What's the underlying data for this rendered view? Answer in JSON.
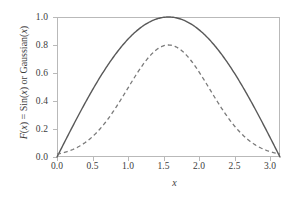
{
  "chart_data": {
    "type": "line",
    "title": "",
    "xlabel": "x",
    "ylabel": "F(x) = Sin(x) or Gaussian(x)",
    "xlim": [
      0.0,
      3.14159
    ],
    "ylim": [
      0.0,
      1.0
    ],
    "grid": false,
    "legend": null,
    "xticks": [
      "0.0",
      "0.5",
      "1.0",
      "1.5",
      "2.0",
      "2.5",
      "3.0"
    ],
    "xtick_values": [
      0.0,
      0.5,
      1.0,
      1.5,
      2.0,
      2.5,
      3.0
    ],
    "yticks": [
      "0.0",
      "0.2",
      "0.4",
      "0.6",
      "0.8",
      "1.0"
    ],
    "ytick_values": [
      0.0,
      0.2,
      0.4,
      0.6,
      0.8,
      1.0
    ],
    "series": [
      {
        "name": "Sin(x)",
        "style": "solid",
        "color": "#595959",
        "peak_x": 1.5708,
        "peak_y": 1.0,
        "x": [
          0.0,
          0.1571,
          0.3142,
          0.4712,
          0.6283,
          0.7854,
          0.9425,
          1.0996,
          1.2566,
          1.4137,
          1.5708,
          1.7279,
          1.885,
          2.042,
          2.1991,
          2.3562,
          2.5133,
          2.6704,
          2.8274,
          2.9845,
          3.1416
        ],
        "values": [
          0.0,
          0.1564,
          0.309,
          0.454,
          0.5878,
          0.7071,
          0.809,
          0.891,
          0.9511,
          0.9877,
          1.0,
          0.9877,
          0.9511,
          0.891,
          0.809,
          0.7071,
          0.5878,
          0.454,
          0.309,
          0.1564,
          0.0
        ]
      },
      {
        "name": "Gaussian(x)",
        "style": "dashed",
        "color": "#7a7a7a",
        "amplitude": 0.8,
        "center": 1.5708,
        "sigma": 0.58,
        "peak_x": 1.5708,
        "peak_y": 0.8,
        "x": [
          0.0,
          0.1571,
          0.3142,
          0.4712,
          0.6283,
          0.7854,
          0.9425,
          1.0996,
          1.2566,
          1.4137,
          1.5708,
          1.7279,
          1.885,
          2.042,
          2.1991,
          2.3562,
          2.5133,
          2.6704,
          2.8274,
          2.9845,
          3.1416
        ],
        "values": [
          0.0201,
          0.0333,
          0.0526,
          0.0795,
          0.1151,
          0.1595,
          0.2117,
          0.269,
          0.3277,
          0.383,
          0.4304,
          0.4665,
          0.4891,
          0.4975,
          0.4921,
          0.4747,
          0.4476,
          0.4136,
          0.3754,
          0.3354,
          0.2957
        ]
      }
    ]
  },
  "axes": {
    "frame_color": "#b9b9b9",
    "background": "#ffffff"
  }
}
